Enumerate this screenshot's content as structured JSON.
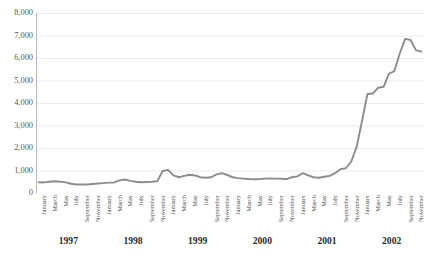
{
  "figure": {
    "clipped_top_text": "",
    "line_color": "#8c8c8c",
    "gridline_color": "#e4e4e6",
    "axis_color": "#b0b0b2",
    "background": "#ffffff"
  },
  "yaxis": {
    "ticks": [
      "8,000",
      "7,000",
      "6,000",
      "5,000",
      "4,000",
      "3,000",
      "2,000",
      "1,000",
      "0"
    ],
    "min": 0,
    "max": 8000,
    "step": 1000
  },
  "years": [
    "1997",
    "1998",
    "1999",
    "2000",
    "2001",
    "2002"
  ],
  "month_labels": [
    "January",
    "March",
    "May",
    "July",
    "September",
    "November",
    "January",
    "March",
    "May",
    "July",
    "September",
    "November",
    "January",
    "March",
    "May",
    "July",
    "September",
    "November",
    "January",
    "March",
    "May",
    "July",
    "September",
    "November",
    "January",
    "March",
    "May",
    "July",
    "September",
    "November",
    "January",
    "March",
    "May",
    "July",
    "September",
    "November"
  ],
  "chart_data": {
    "type": "line",
    "title": "",
    "xlabel": "",
    "ylabel": "",
    "ylim": [
      0,
      8000
    ],
    "ytick_step": 1000,
    "grid": true,
    "legend": false,
    "x": [
      "1997-01",
      "1997-02",
      "1997-03",
      "1997-04",
      "1997-05",
      "1997-06",
      "1997-07",
      "1997-08",
      "1997-09",
      "1997-10",
      "1997-11",
      "1997-12",
      "1998-01",
      "1998-02",
      "1998-03",
      "1998-04",
      "1998-05",
      "1998-06",
      "1998-07",
      "1998-08",
      "1998-09",
      "1998-10",
      "1998-11",
      "1998-12",
      "1999-01",
      "1999-02",
      "1999-03",
      "1999-04",
      "1999-05",
      "1999-06",
      "1999-07",
      "1999-08",
      "1999-09",
      "1999-10",
      "1999-11",
      "1999-12",
      "2000-01",
      "2000-02",
      "2000-03",
      "2000-04",
      "2000-05",
      "2000-06",
      "2000-07",
      "2000-08",
      "2000-09",
      "2000-10",
      "2000-11",
      "2000-12",
      "2001-01",
      "2001-02",
      "2001-03",
      "2001-04",
      "2001-05",
      "2001-06",
      "2001-07",
      "2001-08",
      "2001-09",
      "2001-10",
      "2001-11",
      "2001-12",
      "2002-01",
      "2002-02",
      "2002-03",
      "2002-04",
      "2002-05",
      "2002-06",
      "2002-07",
      "2002-08",
      "2002-09",
      "2002-10",
      "2002-11",
      "2002-12"
    ],
    "categories": [
      "January 1997",
      "February 1997",
      "March 1997",
      "April 1997",
      "May 1997",
      "June 1997",
      "July 1997",
      "August 1997",
      "September 1997",
      "October 1997",
      "November 1997",
      "December 1997",
      "January 1998",
      "February 1998",
      "March 1998",
      "April 1998",
      "May 1998",
      "June 1998",
      "July 1998",
      "August 1998",
      "September 1998",
      "October 1998",
      "November 1998",
      "December 1998",
      "January 1999",
      "February 1999",
      "March 1999",
      "April 1999",
      "May 1999",
      "June 1999",
      "July 1999",
      "August 1999",
      "September 1999",
      "October 1999",
      "November 1999",
      "December 1999",
      "January 2000",
      "February 2000",
      "March 2000",
      "April 2000",
      "May 2000",
      "June 2000",
      "July 2000",
      "August 2000",
      "September 2000",
      "October 2000",
      "November 2000",
      "December 2000",
      "January 2001",
      "February 2001",
      "March 2001",
      "April 2001",
      "May 2001",
      "June 2001",
      "July 2001",
      "August 2001",
      "September 2001",
      "October 2001",
      "November 2001",
      "December 2001",
      "January 2002",
      "February 2002",
      "March 2002",
      "April 2002",
      "May 2002",
      "June 2002",
      "July 2002",
      "August 2002",
      "September 2002",
      "October 2002",
      "November 2002",
      "December 2002"
    ],
    "values": [
      480,
      470,
      500,
      520,
      500,
      470,
      410,
      380,
      375,
      380,
      400,
      420,
      440,
      460,
      470,
      560,
      600,
      540,
      500,
      480,
      490,
      500,
      520,
      980,
      1030,
      780,
      700,
      760,
      810,
      780,
      700,
      680,
      700,
      830,
      880,
      800,
      700,
      660,
      640,
      620,
      610,
      620,
      640,
      650,
      640,
      630,
      620,
      700,
      740,
      880,
      780,
      700,
      680,
      720,
      760,
      880,
      1060,
      1100,
      1400,
      2050,
      3200,
      4400,
      4420,
      4680,
      4720,
      5300,
      5420,
      6200,
      6850,
      6800,
      6350,
      6280
    ],
    "peak": {
      "category": "September 2002",
      "value": 6850
    },
    "minimum": {
      "category": "September 1997",
      "value": 375
    },
    "first_value": 480,
    "last_value": 6280
  }
}
